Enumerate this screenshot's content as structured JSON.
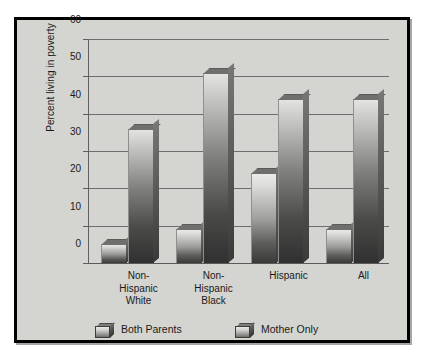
{
  "chart_data": {
    "type": "bar",
    "title": "",
    "xlabel": "",
    "ylabel": "Percent living in poverty",
    "ylim": [
      0,
      60
    ],
    "ytick_values": [
      60,
      50,
      40,
      30,
      20,
      10,
      0
    ],
    "ytick_labels": [
      "60",
      "50",
      "40",
      "30",
      "20",
      "10",
      "0"
    ],
    "grid": true,
    "legend_position": "bottom-left",
    "categories": [
      "Non-Hispanic White",
      "Non-Hispanic Black",
      "Hispanic",
      "All"
    ],
    "category_label_lines": [
      [
        "Non-",
        "Hispanic",
        "White"
      ],
      [
        "Non-",
        "Hispanic",
        "Black"
      ],
      [
        "Hispanic"
      ],
      [
        "All"
      ]
    ],
    "series": [
      {
        "name": "Both Parents",
        "values": [
          5,
          9,
          24,
          9
        ]
      },
      {
        "name": "Mother Only",
        "values": [
          36,
          51,
          44,
          44
        ]
      }
    ],
    "colors": {
      "frame_border": "#000000",
      "plot_background": "#d4d4d0",
      "gridline": "#6d6d6d",
      "bar_light": "#ebebe9",
      "bar_dark": "#3a3a39",
      "text": "#1a1a1a"
    }
  },
  "legend": {
    "items": [
      {
        "label": "Both Parents"
      },
      {
        "label": "Mother Only"
      }
    ]
  }
}
